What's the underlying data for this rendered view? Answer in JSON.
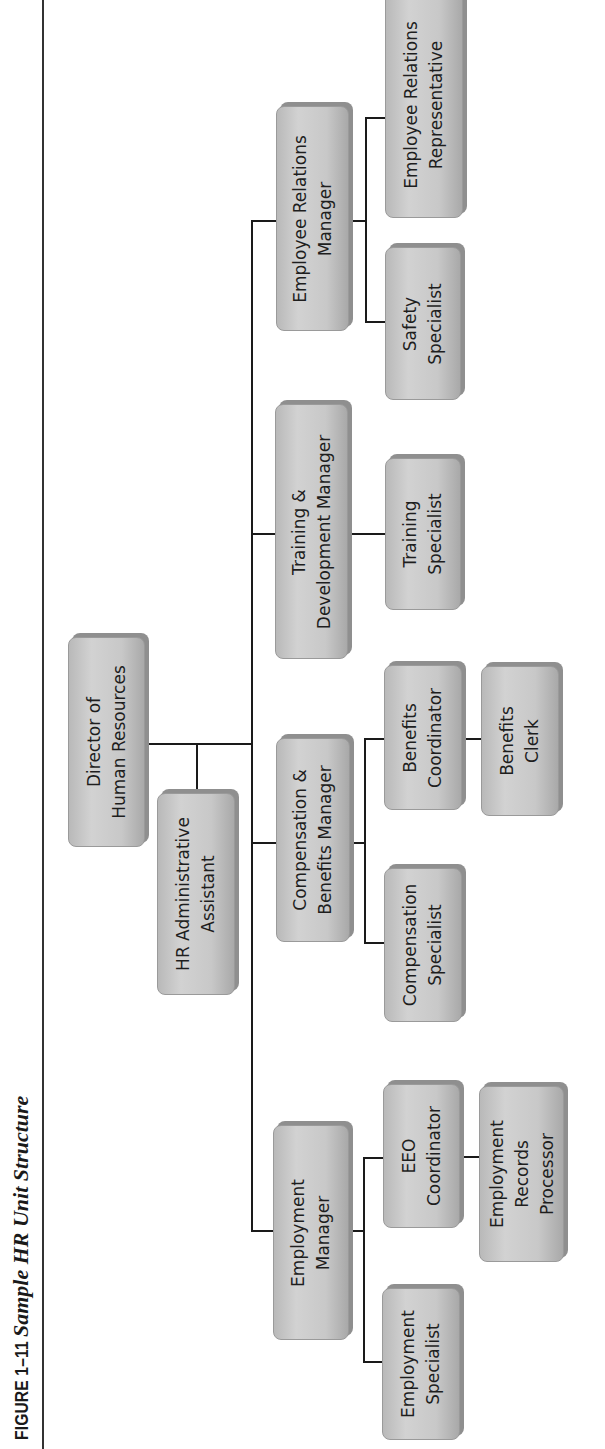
{
  "figure": {
    "number": "FIGURE 1–11",
    "title": "Sample HR Unit Structure"
  },
  "chart": {
    "type": "org-chart",
    "orientation": "rotated-90-ccw",
    "line_color": "#1a1a1a",
    "box_color": "#c8c8c8",
    "root": {
      "id": "director",
      "lines": [
        "Director of",
        "Human Resources"
      ],
      "assistant": {
        "id": "hr-admin",
        "lines": [
          "HR Administrative",
          "Assistant"
        ]
      },
      "children": [
        {
          "id": "employment-manager",
          "lines": [
            "Employment",
            "Manager"
          ],
          "children": [
            {
              "id": "employment-specialist",
              "lines": [
                "Employment",
                "Specialist"
              ]
            },
            {
              "id": "eeo-coordinator",
              "lines": [
                "EEO",
                "Coordinator"
              ],
              "children": [
                {
                  "id": "employment-records-processor",
                  "lines": [
                    "Employment",
                    "Records",
                    "Processor"
                  ]
                }
              ]
            }
          ]
        },
        {
          "id": "comp-benefits-manager",
          "lines": [
            "Compensation &",
            "Benefits Manager"
          ],
          "children": [
            {
              "id": "compensation-specialist",
              "lines": [
                "Compensation",
                "Specialist"
              ]
            },
            {
              "id": "benefits-coordinator",
              "lines": [
                "Benefits",
                "Coordinator"
              ],
              "children": [
                {
                  "id": "benefits-clerk",
                  "lines": [
                    "Benefits",
                    "Clerk"
                  ]
                }
              ]
            }
          ]
        },
        {
          "id": "training-dev-manager",
          "lines": [
            "Training &",
            "Development Manager"
          ],
          "children": [
            {
              "id": "training-specialist",
              "lines": [
                "Training",
                "Specialist"
              ]
            }
          ]
        },
        {
          "id": "employee-relations-manager",
          "lines": [
            "Employee Relations",
            "Manager"
          ],
          "children": [
            {
              "id": "safety-specialist",
              "lines": [
                "Safety",
                "Specialist"
              ]
            },
            {
              "id": "employee-relations-rep",
              "lines": [
                "Employee Relations",
                "Representative"
              ]
            }
          ]
        }
      ]
    }
  },
  "nodes": {
    "director": [
      "Director of",
      "Human Resources"
    ],
    "hr_admin": [
      "HR Administrative",
      "Assistant"
    ],
    "employment_manager": [
      "Employment",
      "Manager"
    ],
    "employment_specialist": [
      "Employment",
      "Specialist"
    ],
    "eeo_coordinator": [
      "EEO",
      "Coordinator"
    ],
    "employment_records_processor": [
      "Employment",
      "Records",
      "Processor"
    ],
    "comp_benefits_manager": [
      "Compensation &",
      "Benefits Manager"
    ],
    "compensation_specialist": [
      "Compensation",
      "Specialist"
    ],
    "benefits_coordinator": [
      "Benefits",
      "Coordinator"
    ],
    "benefits_clerk": [
      "Benefits",
      "Clerk"
    ],
    "training_dev_manager": [
      "Training &",
      "Development Manager"
    ],
    "training_specialist": [
      "Training",
      "Specialist"
    ],
    "employee_relations_manager": [
      "Employee Relations",
      "Manager"
    ],
    "safety_specialist": [
      "Safety",
      "Specialist"
    ],
    "employee_relations_rep": [
      "Employee Relations",
      "Representative"
    ]
  }
}
